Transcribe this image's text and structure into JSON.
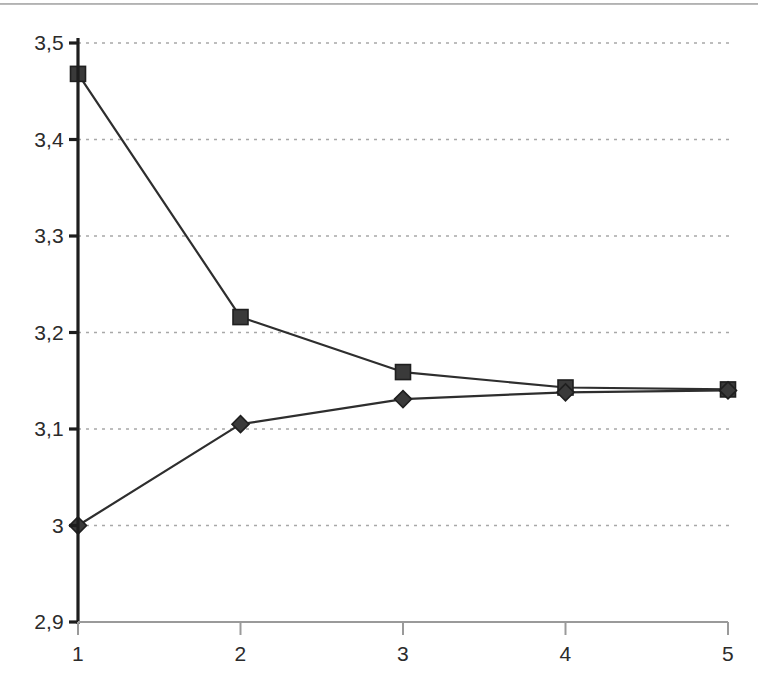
{
  "chart_data": {
    "type": "line",
    "title": "",
    "subtitle": "",
    "xlabel": "",
    "ylabel": "",
    "x": [
      1,
      2,
      3,
      4,
      5
    ],
    "categories": [
      "1",
      "2",
      "3",
      "4",
      "5"
    ],
    "xtick_labels": [
      "1",
      "2",
      "3",
      "4",
      "5"
    ],
    "ytick_labels": [
      "3,5",
      "3,4",
      "3,3",
      "3,2",
      "3,1",
      "3",
      "2,9"
    ],
    "ytick_values": [
      3.5,
      3.4,
      3.3,
      3.2,
      3.1,
      3.0,
      2.9
    ],
    "xlim": [
      1,
      5
    ],
    "ylim": [
      2.9,
      3.5
    ],
    "grid": "horizontal-dotted",
    "legend": "none",
    "decimal_separator": ",",
    "series": [
      {
        "name": "upper-series",
        "marker": "square",
        "color": "#3a3a3a",
        "values": [
          3.468,
          3.216,
          3.159,
          3.143,
          3.141
        ]
      },
      {
        "name": "lower-series",
        "marker": "diamond",
        "color": "#3a3a3a",
        "values": [
          3.0,
          3.105,
          3.131,
          3.138,
          3.14
        ]
      }
    ]
  },
  "style": {
    "axis_color": "#1d1d1d",
    "x_axis_color": "#9a9a9a",
    "grid_color": "#a8a8a8",
    "line_color": "#2e2e2e",
    "marker_color": "#3f3f3f",
    "text_color": "#2b2b2b",
    "background": "#ffffff"
  }
}
